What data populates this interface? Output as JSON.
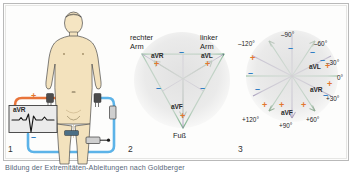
{
  "figure": {
    "caption": "Bildung der Extremitäten-Ableitungen nach Goldberger",
    "colors": {
      "positive": "#e2762e",
      "negative": "#2f7fc4",
      "triangle_green": "#4d9b63",
      "axis_purple": "#7a6a9e",
      "skin": "#f3e2bd",
      "cable_orange": "#e8743a",
      "cable_blue": "#5cb3e8",
      "halo_gray": "#e0e0e0"
    }
  },
  "panel1": {
    "number": "1",
    "ecg_box": {
      "lead_label": "aVR"
    },
    "plus_sign": "+",
    "minus_sign": "–"
  },
  "panel2": {
    "number": "2",
    "vertices": [
      {
        "name": "right-arm",
        "label": "rechter\nArm"
      },
      {
        "name": "left-arm",
        "label": "linker\nArm"
      },
      {
        "name": "foot",
        "label": "Fuß"
      }
    ],
    "vertex_labels": {
      "right_arm_line1": "rechter",
      "right_arm_line2": "Arm",
      "left_arm_line1": "linker",
      "left_arm_line2": "Arm",
      "foot": "Fuß"
    },
    "leads": [
      {
        "name": "aVR",
        "label": "aVR"
      },
      {
        "name": "aVL",
        "label": "aVL"
      },
      {
        "name": "aVF",
        "label": "aVF"
      }
    ],
    "plus_sign": "+",
    "minus_sign": "–"
  },
  "panel3": {
    "number": "3",
    "degree_labels": [
      {
        "name": "deg-minus-120",
        "text": "–120°"
      },
      {
        "name": "deg-minus-90",
        "text": "–90°"
      },
      {
        "name": "deg-minus-60",
        "text": "–60°"
      },
      {
        "name": "deg-minus-30",
        "text": "–30°"
      },
      {
        "name": "deg-zero",
        "text": "0°"
      },
      {
        "name": "deg-plus-30",
        "text": "+30°"
      },
      {
        "name": "deg-plus-60",
        "text": "+60°"
      },
      {
        "name": "deg-plus-90",
        "text": "+90°"
      },
      {
        "name": "deg-plus-120",
        "text": "+120°"
      }
    ],
    "leads": [
      {
        "name": "aVL",
        "label": "aVL"
      },
      {
        "name": "aVR",
        "label": "aVR"
      },
      {
        "name": "aVF",
        "label": "aVF"
      }
    ],
    "plus_sign": "+",
    "minus_sign": "–"
  }
}
